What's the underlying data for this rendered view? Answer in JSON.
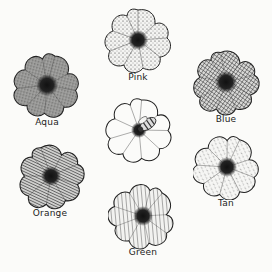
{
  "diagram": {
    "type": "flower color preference illustration",
    "center_flower": {
      "label": "",
      "has_bee": true,
      "pattern": "plain"
    },
    "flowers": [
      {
        "label": "Pink",
        "pattern": "fine-dots",
        "cx": 138,
        "cy": 40,
        "label_y": 74
      },
      {
        "label": "Aqua",
        "pattern": "dense-stipple",
        "cx": 47,
        "cy": 85,
        "label_y": 118
      },
      {
        "label": "Blue",
        "pattern": "crosshatch",
        "cx": 226,
        "cy": 82,
        "label_y": 115
      },
      {
        "label": "Orange",
        "pattern": "dense-diagonal",
        "cx": 51,
        "cy": 176,
        "label_y": 210
      },
      {
        "label": "Tan",
        "pattern": "light-dashes",
        "cx": 227,
        "cy": 167,
        "label_y": 200
      },
      {
        "label": "Green",
        "pattern": "sparse-diagonal",
        "cx": 143,
        "cy": 217,
        "label_y": 249
      }
    ]
  },
  "colors": {
    "ink": "#222222",
    "background": "#fbfbf9"
  }
}
